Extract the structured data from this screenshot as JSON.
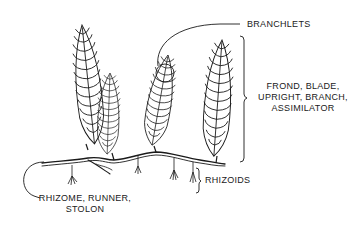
{
  "diagram": {
    "type": "labeled botanical illustration",
    "line_color": "#1a1a1a",
    "background": "#ffffff",
    "labels": {
      "branchlets": "BRANCHLETS",
      "frond_line1": "FROND, BLADE,",
      "frond_line2": "UPRIGHT, BRANCH,",
      "frond_line3": "ASSIMILATOR",
      "rhizoids": "RHIZOIDS",
      "rhizome_line1": "RHIZOME, RUNNER,",
      "rhizome_line2": "STOLON"
    },
    "fronds": [
      {
        "name": "frond-1",
        "x": 72,
        "top": 25,
        "base": 150
      },
      {
        "name": "frond-2",
        "x": 110,
        "top": 73,
        "base": 158
      },
      {
        "name": "frond-3",
        "x": 168,
        "top": 55,
        "base": 148
      },
      {
        "name": "frond-4",
        "x": 220,
        "top": 40,
        "base": 160
      }
    ]
  }
}
